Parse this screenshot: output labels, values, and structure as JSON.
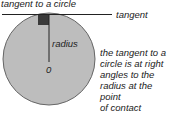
{
  "diagram": {
    "title": "tangent to a circle",
    "tangent_label": "tangent",
    "radius_label": "radius",
    "center_label": "0",
    "note_lines": [
      "the tangent to a",
      "circle is at right",
      "angles to the",
      "radius at the point",
      "of contact"
    ],
    "colors": {
      "circle_fill": "#bdbdbd",
      "circle_stroke": "#666666",
      "line": "#222222",
      "right_angle_marker": "#3a3a3a"
    }
  }
}
